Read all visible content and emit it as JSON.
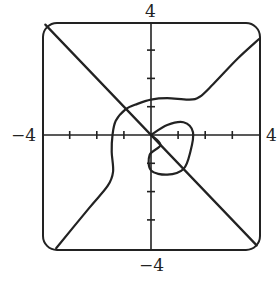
{
  "chart_data": {
    "type": "line",
    "title": "",
    "xlabel": "",
    "ylabel": "",
    "xlim": [
      -4,
      4
    ],
    "ylim": [
      -4,
      4
    ],
    "grid": false,
    "legend": null,
    "tick_labels": {
      "x_left": "−4",
      "x_right": "4",
      "y_top": "4",
      "y_bottom": "−4"
    },
    "ticks": [
      -3,
      -2,
      -1,
      1,
      2,
      3
    ],
    "frame": "rounded-rectangle",
    "series": [
      {
        "name": "diagonal-line",
        "points": [
          [
            -3.9,
            3.9
          ],
          [
            3.9,
            -3.9
          ]
        ]
      },
      {
        "name": "main-curve",
        "points": [
          [
            4.0,
            3.4
          ],
          [
            3.2,
            2.7
          ],
          [
            2.3,
            1.8
          ],
          [
            1.8,
            1.35
          ],
          [
            1.4,
            1.25
          ],
          [
            0.6,
            1.3
          ],
          [
            0.0,
            1.25
          ],
          [
            -0.5,
            1.1
          ],
          [
            -0.95,
            0.9
          ],
          [
            -1.3,
            0.5
          ],
          [
            -1.42,
            0.0
          ],
          [
            -1.45,
            -0.6
          ],
          [
            -1.4,
            -1.3
          ],
          [
            -1.6,
            -1.8
          ],
          [
            -2.3,
            -2.6
          ],
          [
            -3.5,
            -4.0
          ]
        ]
      },
      {
        "name": "closed-loop",
        "points": [
          [
            0.0,
            0.0
          ],
          [
            0.6,
            0.35
          ],
          [
            1.2,
            0.45
          ],
          [
            1.55,
            0.1
          ],
          [
            1.45,
            -0.6
          ],
          [
            1.2,
            -1.2
          ],
          [
            0.6,
            -1.4
          ],
          [
            0.0,
            -1.25
          ],
          [
            -0.05,
            -0.7
          ],
          [
            0.35,
            -0.35
          ],
          [
            0.0,
            0.0
          ]
        ]
      }
    ]
  }
}
